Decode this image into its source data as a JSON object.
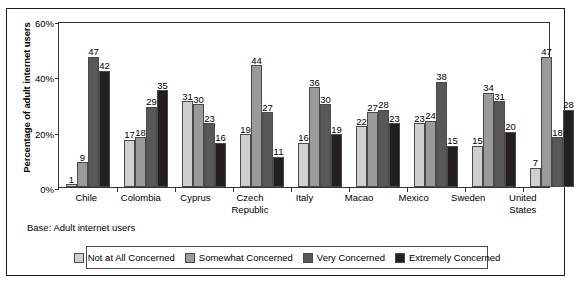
{
  "chart_data": {
    "type": "bar",
    "title": "",
    "xlabel": "",
    "ylabel": "Percentage of adult internet users",
    "ylim": [
      0,
      60
    ],
    "yticks": [
      "0%",
      "20%",
      "40%",
      "60%"
    ],
    "ytick_values": [
      0,
      20,
      40,
      60
    ],
    "grid": false,
    "legend_position": "bottom",
    "categories": [
      "Chile",
      "Colombia",
      "Cyprus",
      "Czech Republic",
      "Italy",
      "Macao",
      "Mexico",
      "Sweden",
      "United States"
    ],
    "series": [
      {
        "name": "Not at All Concerned",
        "color": "#cfcfcf",
        "values": [
          1,
          17,
          31,
          19,
          16,
          22,
          23,
          15,
          7
        ]
      },
      {
        "name": "Somewhat Concerned",
        "color": "#9a9a9a",
        "values": [
          9,
          18,
          30,
          44,
          36,
          27,
          24,
          34,
          47
        ]
      },
      {
        "name": "Very Concerned",
        "color": "#585858",
        "values": [
          47,
          29,
          23,
          27,
          30,
          28,
          38,
          31,
          18
        ]
      },
      {
        "name": "Extremely Concerned",
        "color": "#231f1e",
        "values": [
          42,
          35,
          16,
          11,
          19,
          23,
          15,
          20,
          28
        ]
      }
    ],
    "annotations": [
      "Base: Adult internet users"
    ]
  },
  "notes": {
    "base": "Base: Adult internet users"
  }
}
